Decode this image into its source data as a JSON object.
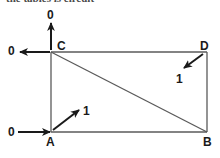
{
  "figure": {
    "type": "logic-circuit-diagram",
    "caption_partial": "the tables is circuit",
    "background_color": "#ffffff",
    "line_color": "#5a5a5a",
    "arrow_color": "#1a1a1a",
    "label_color": "#1a1a1a"
  },
  "nodes": [
    {
      "id": "A",
      "label": "A",
      "x": 51,
      "y": 132,
      "label_x": 46,
      "label_y": 136
    },
    {
      "id": "B",
      "label": "B",
      "x": 207,
      "y": 132,
      "label_x": 203,
      "label_y": 136
    },
    {
      "id": "C",
      "label": "C",
      "x": 51,
      "y": 52,
      "label_x": 57,
      "label_y": 40
    },
    {
      "id": "D",
      "label": "D",
      "x": 207,
      "y": 52,
      "label_x": 200,
      "label_y": 40
    }
  ],
  "edges": [
    {
      "name": "left-side-AC",
      "from": "A",
      "to": "C"
    },
    {
      "name": "right-side-BD",
      "from": "B",
      "to": "D"
    },
    {
      "name": "top-side-CD",
      "from": "C",
      "to": "D"
    },
    {
      "name": "bottom-side-AB",
      "from": "A",
      "to": "B"
    },
    {
      "name": "diagonal-CB",
      "from": "C",
      "to": "B"
    }
  ],
  "signals": [
    {
      "name": "input-bottom-left",
      "value": "0",
      "direction": "right",
      "label_x": 8,
      "label_y": 126,
      "tail_x": 18,
      "tail_y": 132,
      "head_x": 50,
      "head_y": 132
    },
    {
      "name": "diagonal-at-A",
      "value": "1",
      "direction": "up-right",
      "label_x": 83,
      "label_y": 105,
      "tail_x": 53,
      "tail_y": 130,
      "head_x": 79,
      "head_y": 110
    },
    {
      "name": "output-left-at-C",
      "value": "0",
      "direction": "left",
      "label_x": 8,
      "label_y": 45,
      "tail_x": 50,
      "tail_y": 52,
      "head_x": 20,
      "head_y": 52
    },
    {
      "name": "output-top-at-C",
      "value": "0",
      "direction": "up",
      "label_x": 47,
      "label_y": 9,
      "tail_x": 51,
      "tail_y": 50,
      "head_x": 51,
      "head_y": 23
    },
    {
      "name": "input-at-D",
      "value": "1",
      "direction": "up-right",
      "label_x": 176,
      "label_y": 73,
      "tail_x": 203,
      "tail_y": 54,
      "head_x": 184,
      "head_y": 68
    }
  ]
}
